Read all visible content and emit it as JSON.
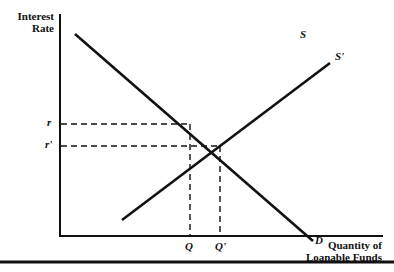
{
  "chart_data": {
    "type": "line",
    "title": "",
    "xlabel": "Quantity of Loanable Funds",
    "ylabel": "Interest Rate",
    "ylabel_lines": [
      "Interest",
      "Rate"
    ],
    "xlabel_lines": [
      "Quantity of",
      "Loanable Funds"
    ],
    "grid": false,
    "legend": "none",
    "series": [
      {
        "name": "D",
        "label": "D",
        "points": [
          [
            75,
            34
          ],
          [
            313,
            241
          ]
        ],
        "style": "solid"
      },
      {
        "name": "S'",
        "label": "S'",
        "points": [
          [
            122,
            220
          ],
          [
            330,
            63
          ]
        ],
        "style": "solid"
      },
      {
        "name": "S",
        "label": "S",
        "points": [],
        "style": "label-only"
      }
    ],
    "reference_lines": [
      {
        "label": "r",
        "type": "horizontal",
        "y": 124,
        "x_to": 190,
        "style": "dashed"
      },
      {
        "label": "r'",
        "type": "horizontal",
        "y": 146,
        "x_to": 220,
        "style": "dashed"
      },
      {
        "label": "Q",
        "type": "vertical",
        "x": 190,
        "y_from": 124,
        "style": "dashed"
      },
      {
        "label": "Q'",
        "type": "vertical",
        "x": 220,
        "y_from": 146,
        "style": "dashed"
      }
    ],
    "y_tick_labels": [
      "r",
      "r'"
    ],
    "x_tick_labels": [
      "Q",
      "Q'"
    ],
    "curve_labels": {
      "S": "S",
      "S_prime": "S'",
      "D": "D"
    }
  },
  "colors": {
    "line": "#111111",
    "background": "#ffffff"
  }
}
